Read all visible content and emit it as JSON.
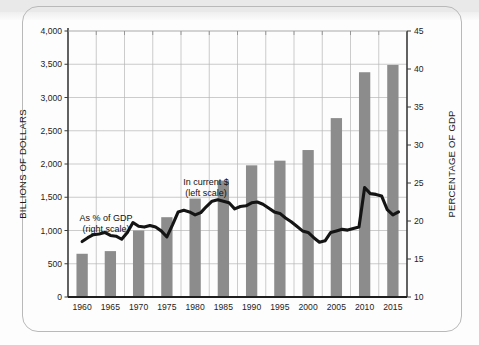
{
  "chart_data": {
    "type": "bar",
    "title": "",
    "xlabel": "",
    "ylabel": "BILLIONS OF DOLLARS",
    "y2label": "PERCENTAGE OF GDP",
    "categories": [
      "1960",
      "1965",
      "1970",
      "1975",
      "1980",
      "1985",
      "1990",
      "1995",
      "2000",
      "2005",
      "2010",
      "2015"
    ],
    "ylim": [
      0,
      4000
    ],
    "yticks": [
      "0",
      "500",
      "1,000",
      "1,500",
      "2,000",
      "2,500",
      "3,000",
      "3,500",
      "4,000"
    ],
    "ytick_values": [
      0,
      500,
      1000,
      1500,
      2000,
      2500,
      3000,
      3500,
      4000
    ],
    "y2lim": [
      10,
      45
    ],
    "y2ticks": [
      "10",
      "15",
      "20",
      "25",
      "30",
      "35",
      "40",
      "45"
    ],
    "y2tick_values": [
      10,
      15,
      20,
      25,
      30,
      35,
      40,
      45
    ],
    "grid": true,
    "legend_position": "inline-annotations",
    "series": [
      {
        "name": "In current $",
        "type": "bar",
        "axis": "left",
        "unit": "Billions of dollars",
        "color": "#8c8c8c",
        "categories": [
          "1960",
          "1965",
          "1970",
          "1975",
          "1980",
          "1985",
          "1990",
          "1995",
          "2000",
          "2005",
          "2010",
          "2015"
        ],
        "values": [
          650,
          690,
          1000,
          1200,
          1480,
          1750,
          1980,
          2050,
          2210,
          2690,
          3380,
          3490
        ]
      },
      {
        "name": "As % of GDP",
        "type": "line",
        "axis": "right",
        "unit": "Percentage of GDP",
        "color": "#141414",
        "x": [
          1960,
          1961,
          1962,
          1963,
          1964,
          1965,
          1966,
          1967,
          1968,
          1969,
          1970,
          1971,
          1972,
          1973,
          1974,
          1975,
          1976,
          1977,
          1978,
          1979,
          1980,
          1981,
          1982,
          1983,
          1984,
          1985,
          1986,
          1987,
          1988,
          1989,
          1990,
          1991,
          1992,
          1993,
          1994,
          1995,
          1996,
          1997,
          1998,
          1999,
          2000,
          2001,
          2002,
          2003,
          2004,
          2005,
          2006,
          2007,
          2008,
          2009,
          2010,
          2011,
          2012,
          2013,
          2014,
          2015,
          2016
        ],
        "values": [
          17.3,
          17.8,
          18.2,
          18.3,
          18.5,
          18.1,
          18.0,
          17.6,
          18.5,
          19.8,
          19.3,
          19.2,
          19.4,
          19.2,
          18.7,
          17.9,
          19.5,
          21.2,
          21.4,
          21.2,
          20.8,
          21.1,
          21.9,
          22.6,
          22.8,
          22.6,
          22.4,
          21.6,
          21.9,
          22.0,
          22.4,
          22.5,
          22.2,
          21.7,
          21.2,
          21.0,
          20.4,
          19.9,
          19.3,
          18.7,
          18.5,
          17.8,
          17.2,
          17.4,
          18.5,
          18.7,
          18.9,
          18.8,
          19.0,
          19.2,
          24.4,
          23.6,
          23.5,
          23.3,
          21.5,
          20.8,
          21.2
        ]
      }
    ],
    "annotations": [
      {
        "name": "bars-annotation",
        "line1": "In current $",
        "line2": "(left scale)"
      },
      {
        "name": "line-annotation",
        "line1": "As % of GDP",
        "line2": "(right scale)"
      }
    ]
  },
  "axes": {
    "left_title": "BILLIONS OF DOLLARS",
    "right_title": "PERCENTAGE OF GDP"
  }
}
